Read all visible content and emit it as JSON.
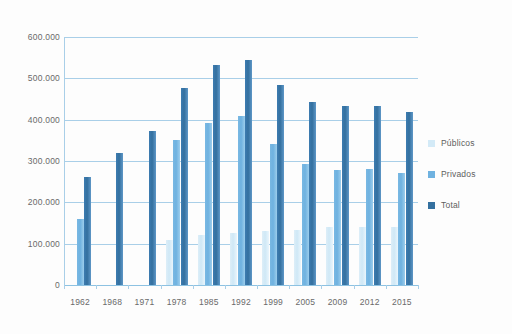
{
  "chart_data": {
    "type": "bar",
    "title": "",
    "subtitle": "",
    "xlabel": "",
    "ylabel": "",
    "ylim": [
      0,
      600000
    ],
    "ytick_labels": [
      "0",
      "100.000",
      "200.000",
      "300.000",
      "400.000",
      "500.000",
      "600.000"
    ],
    "ytick_values": [
      0,
      100000,
      200000,
      300000,
      400000,
      500000,
      600000
    ],
    "grid": true,
    "legend_position": "right",
    "categories": [
      "1962",
      "1968",
      "1971",
      "1978",
      "1985",
      "1992",
      "1999",
      "2005",
      "2009",
      "2012",
      "2015"
    ],
    "series": [
      {
        "name": "Públicos",
        "color": "#d3eaf7",
        "values": [
          0,
          0,
          0,
          110000,
          120000,
          125000,
          130000,
          133000,
          140000,
          140000,
          140000
        ]
      },
      {
        "name": "Privados",
        "color": "#6fb2e0",
        "values": [
          160000,
          0,
          0,
          350000,
          393000,
          408000,
          340000,
          292000,
          278000,
          281000,
          272000
        ]
      },
      {
        "name": "Total",
        "color": "#34709f",
        "values": [
          261000,
          320000,
          372000,
          477000,
          532000,
          545000,
          485000,
          443000,
          432000,
          432000,
          418000
        ]
      }
    ]
  },
  "legend": {
    "items": [
      {
        "label": "Públicos",
        "color": "#d3eaf7"
      },
      {
        "label": "Privados",
        "color": "#6fb2e0"
      },
      {
        "label": "Total",
        "color": "#34709f"
      }
    ]
  }
}
